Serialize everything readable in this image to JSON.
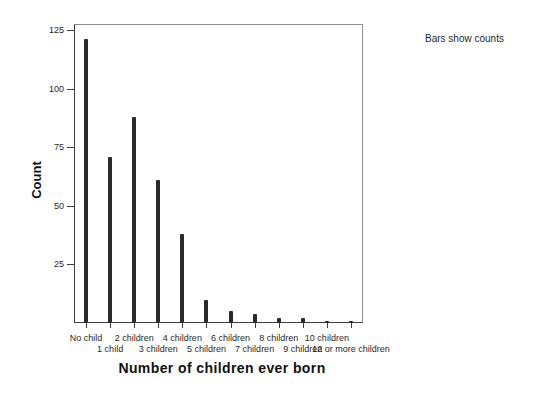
{
  "chart_data": {
    "type": "bar",
    "title": "",
    "xlabel": "Number of children ever born",
    "ylabel": "Count",
    "legend_note": "Bars show counts",
    "legend_position": "top-right",
    "categories": [
      "No child",
      "1 child",
      "2 children",
      "3 children",
      "4 children",
      "5 children",
      "6 children",
      "7 children",
      "8 children",
      "9 children",
      "10 children",
      "12 or more children"
    ],
    "values": [
      121,
      71,
      88,
      61,
      38,
      10,
      5,
      4,
      2,
      2,
      1,
      1
    ],
    "yticks": [
      25,
      50,
      75,
      100,
      125
    ],
    "ylim": [
      0,
      125
    ],
    "grid": false,
    "bar_color": "#2a2a2a",
    "axis_color": "#3c3c3c",
    "frame_color": "#8f8f8f"
  }
}
